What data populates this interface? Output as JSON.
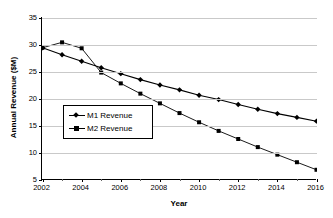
{
  "chart_data": {
    "type": "line",
    "title": "",
    "xlabel": "Year",
    "ylabel": "Annual Revenue ($M)",
    "xlim": [
      2002,
      2016
    ],
    "ylim": [
      5,
      35
    ],
    "grid": true,
    "legend_position": "center-left-inside",
    "x": [
      2002,
      2003,
      2004,
      2005,
      2006,
      2007,
      2008,
      2009,
      2010,
      2011,
      2012,
      2013,
      2014,
      2015,
      2016
    ],
    "xtick_labels": [
      "2002",
      "2004",
      "2006",
      "2008",
      "2010",
      "2012",
      "2014",
      "2016"
    ],
    "xtick_values": [
      2002,
      2004,
      2006,
      2008,
      2010,
      2012,
      2014,
      2016
    ],
    "ytick_labels": [
      "5",
      "10",
      "15",
      "20",
      "25",
      "30",
      "35"
    ],
    "ytick_values": [
      5,
      10,
      15,
      20,
      25,
      30,
      35
    ],
    "series": [
      {
        "name": "M1 Revenue",
        "marker": "diamond",
        "color": "#000000",
        "values": [
          29.4,
          28.1,
          26.9,
          25.7,
          24.6,
          23.5,
          22.5,
          21.6,
          20.6,
          19.8,
          18.9,
          18.0,
          17.2,
          16.5,
          15.8
        ]
      },
      {
        "name": "M2 Revenue",
        "marker": "square",
        "color": "#000000",
        "values": [
          29.4,
          30.4,
          29.3,
          24.8,
          22.8,
          20.9,
          19.1,
          17.3,
          15.6,
          14.0,
          12.5,
          11.0,
          9.6,
          8.2,
          6.8
        ]
      }
    ]
  },
  "legend": {
    "items": [
      {
        "label": "M1 Revenue"
      },
      {
        "label": "M2 Revenue"
      }
    ]
  }
}
